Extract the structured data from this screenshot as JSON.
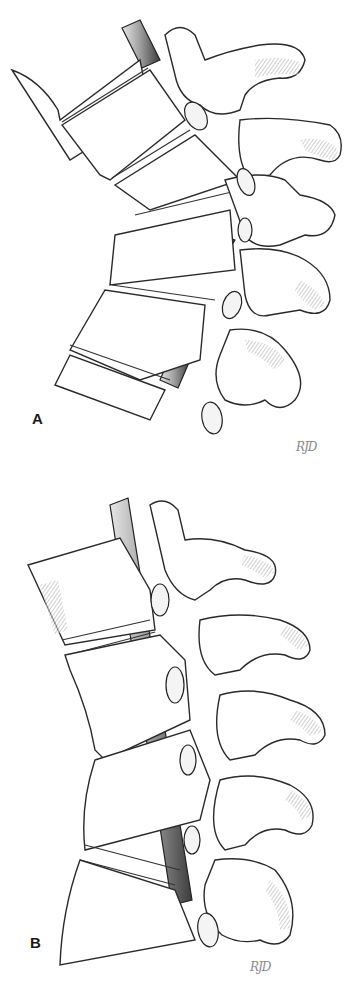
{
  "figure": {
    "panels": [
      {
        "id": "A",
        "label": "A",
        "signature": "RJD",
        "description": "Lateral view of spinal segment with rod, curved alignment"
      },
      {
        "id": "B",
        "label": "B",
        "signature": "RJD",
        "description": "Lateral view of spinal segment with rod, straightened alignment"
      }
    ],
    "colors": {
      "ink": "#2a2a2a",
      "background": "#ffffff",
      "rod_dark": "#555555",
      "rod_light": "#e0e0e0"
    }
  }
}
